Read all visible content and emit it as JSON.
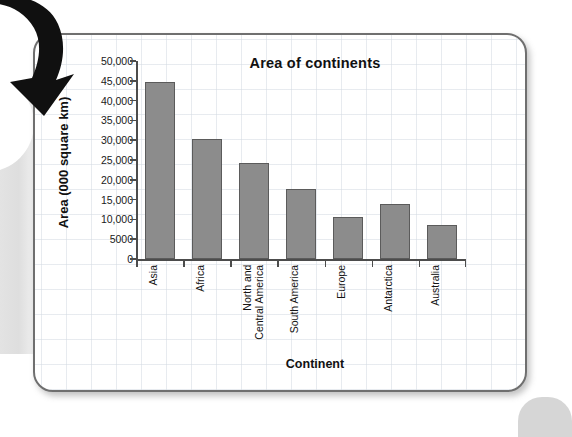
{
  "page": {
    "background_color": "#ffffff",
    "card_border_color": "#6f6f6f",
    "grid_color": "#c6ced a"
  },
  "decor": {
    "arrow_icon": "curved-down-left-arrow",
    "arrow_color": "#101010"
  },
  "chart_data": {
    "type": "bar",
    "title": "Area of continents",
    "xlabel": "Continent",
    "ylabel": "Area (000 square km)",
    "categories": [
      "Asia",
      "Africa",
      "North and\nCentral America",
      "South America",
      "Europe",
      "Antarctica",
      "Australia"
    ],
    "values": [
      44600,
      30300,
      24200,
      17800,
      10500,
      14000,
      8500
    ],
    "ylim": [
      0,
      50000
    ],
    "yticks": [
      0,
      5000,
      10000,
      15000,
      20000,
      25000,
      30000,
      35000,
      40000,
      45000,
      50000
    ],
    "ytick_labels": [
      "0",
      "5000",
      "10,000",
      "15,000",
      "20,000",
      "25,000",
      "30,000",
      "35,000",
      "40,000",
      "45,000",
      "50,000"
    ],
    "grid": false,
    "legend": false,
    "bar_color": "#8c8c8c",
    "bar_edge_color": "#5b5b5b",
    "axis_color": "#4c4c4c"
  }
}
